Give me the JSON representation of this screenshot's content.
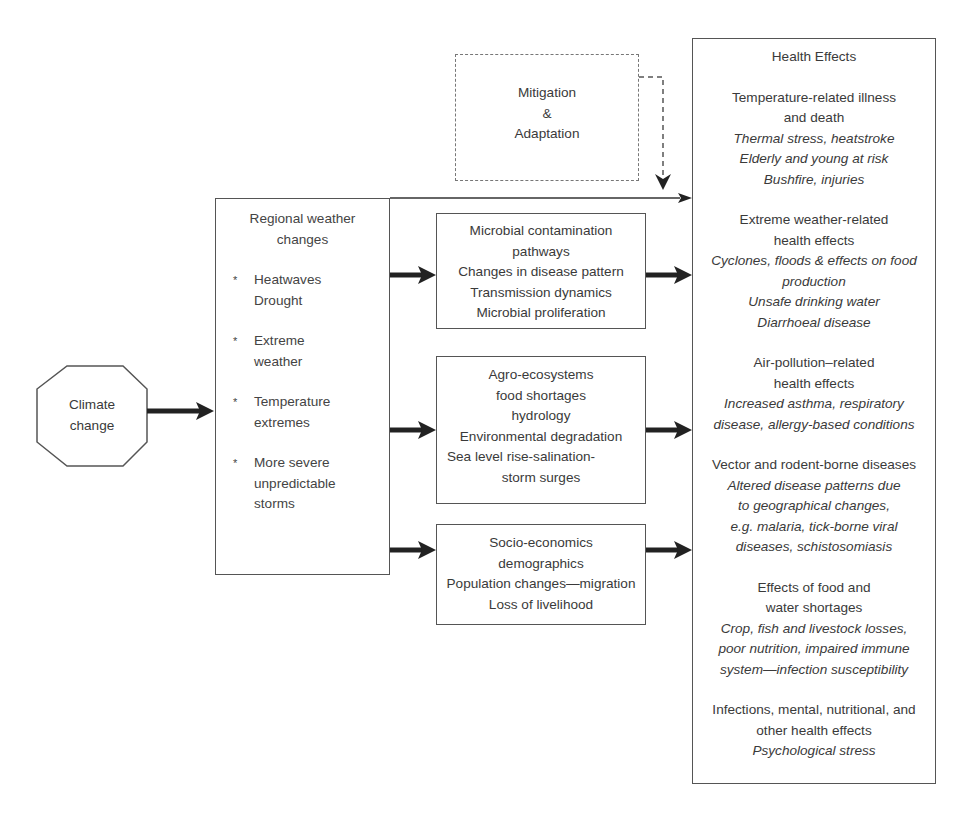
{
  "climate": {
    "label_line1": "Climate",
    "label_line2": "change"
  },
  "mitigation": {
    "line1": "Mitigation",
    "line2": "&",
    "line3": "Adaptation"
  },
  "regional": {
    "title_line1": "Regional weather",
    "title_line2": "changes",
    "bullet_symbol": "*",
    "bullets": [
      {
        "line1": "Heatwaves",
        "line2": "Drought"
      },
      {
        "line1": "Extreme",
        "line2": "weather"
      },
      {
        "line1": "Temperature",
        "line2": "extremes"
      },
      {
        "line1": "More severe",
        "line2": "unpredictable",
        "line3": "storms"
      }
    ]
  },
  "pathways": [
    {
      "lines": [
        "Microbial contamination",
        "pathways",
        "Changes in disease pattern",
        "Transmission dynamics",
        "Microbial proliferation"
      ]
    },
    {
      "lines": [
        "Agro-ecosystems",
        "food shortages",
        "hydrology",
        "Environmental degradation",
        "Sea level rise-salination-",
        "storm surges"
      ]
    },
    {
      "lines": [
        "Socio-economics",
        "demographics",
        "Population changes—migration",
        "Loss of livelihood"
      ]
    }
  ],
  "health": {
    "title": "Health Effects",
    "sections": [
      {
        "heading": [
          "Temperature-related illness",
          "and death"
        ],
        "details": [
          "Thermal stress, heatstroke",
          "Elderly and young at risk",
          "Bushfire, injuries"
        ]
      },
      {
        "heading": [
          "Extreme weather-related",
          "health effects"
        ],
        "details": [
          "Cyclones, floods & effects on food",
          "production",
          "Unsafe drinking water",
          "Diarrhoeal disease"
        ]
      },
      {
        "heading": [
          "Air-pollution–related",
          "health effects"
        ],
        "details": [
          "Increased asthma, respiratory",
          "disease, allergy-based conditions"
        ]
      },
      {
        "heading": [
          "Vector and rodent-borne diseases"
        ],
        "details": [
          "Altered disease patterns due",
          "to geographical changes,",
          "e.g. malaria, tick-borne viral",
          "diseases, schistosomiasis"
        ]
      },
      {
        "heading": [
          "Effects of food and",
          "water shortages"
        ],
        "details": [
          "Crop, fish and livestock losses,",
          "poor nutrition, impaired immune",
          "system—infection susceptibility"
        ]
      },
      {
        "heading": [
          "Infections, mental, nutritional, and",
          "other health effects"
        ],
        "details": [
          "Psychological stress"
        ]
      }
    ]
  }
}
